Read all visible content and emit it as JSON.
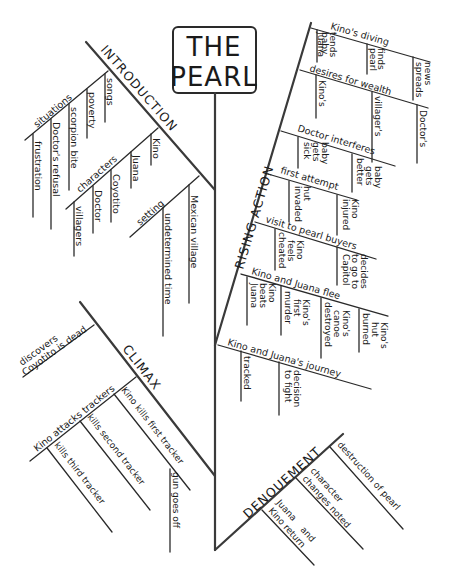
{
  "title": {
    "line1": "THE",
    "line2": "PEARL"
  },
  "sections": {
    "introduction": {
      "label": "INTRODUCTION",
      "situations": {
        "label": "situations",
        "items": [
          "songs",
          "poverty",
          "scorpion bite",
          "Doctor's refusal",
          "frustration"
        ]
      },
      "characters": {
        "label": "characters",
        "items": [
          "Kino",
          "Juana",
          "Coyotito",
          "Doctor",
          "villagers"
        ]
      },
      "setting": {
        "label": "setting",
        "items": [
          "Mexican village",
          "undetermined time"
        ]
      }
    },
    "rising_action": {
      "label": "RISING ACTION",
      "events": [
        {
          "label": "Kino's diving",
          "items": [
            "Juana tends baby",
            "finds pearl",
            "news spreads"
          ]
        },
        {
          "label": "desires for wealth",
          "items": [
            "Kino's",
            "villager's",
            "Doctor's"
          ]
        },
        {
          "label": "Doctor interferes",
          "items": [
            "baby gets sick",
            "baby gets better"
          ]
        },
        {
          "label": "first attempt",
          "items": [
            "hut invaded",
            "Kino injured"
          ]
        },
        {
          "label": "visit to pearl buyers",
          "items": [
            "Kino feels cheated",
            "decides to go to Capitol"
          ]
        },
        {
          "label": "Kino and Juana flee",
          "items": [
            "Kino beats Juana",
            "Kino's first murder",
            "Kino's canoe destroyed",
            "Kino's hut burned"
          ]
        },
        {
          "label": "Kino and Juana's journey",
          "items": [
            "tracked",
            "decision to fight"
          ]
        }
      ]
    },
    "climax": {
      "label": "CLIMAX",
      "discovers": "discovers Coyotito is dead",
      "attacks": {
        "label": "Kino attacks trackers",
        "items": [
          "Kino kills first tracker",
          "kills second tracker",
          "kills third tracker"
        ]
      },
      "gun": "gun goes off"
    },
    "denouement": {
      "label": "DENOUEMENT",
      "items": [
        "destruction of pearl",
        "character changes noted",
        "Juana and Kino return"
      ]
    }
  }
}
